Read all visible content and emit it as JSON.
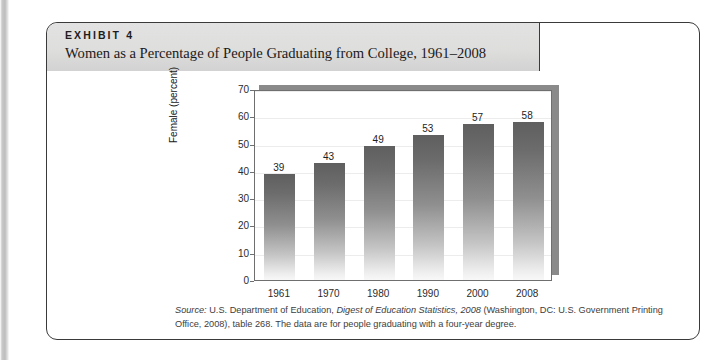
{
  "exhibit": {
    "number_label": "EXHIBIT 4",
    "title": "Women as a Percentage of People Graduating from College, 1961–2008"
  },
  "source": {
    "label": "Source:",
    "text_before_italic": " U.S. Department of Education, ",
    "italic_title": "Digest of Education Statistics, 2008",
    "text_after_italic": " (Washington, DC: U.S. Government Printing Office, 2008), table 268. The data are for people graduating with a four-year degree."
  },
  "chart_data": {
    "type": "bar",
    "title": "Women as a Percentage of People Graduating from College, 1961–2008",
    "categories": [
      "1961",
      "1970",
      "1980",
      "1990",
      "2000",
      "2008"
    ],
    "values": [
      39,
      43,
      49,
      53,
      57,
      58
    ],
    "data_labels": [
      "39",
      "43",
      "49",
      "53",
      "57",
      "58"
    ],
    "xlabel": "",
    "ylabel": "Female (percent)",
    "ylim": [
      0,
      70
    ],
    "ytick_values": [
      0,
      10,
      20,
      30,
      40,
      50,
      60,
      70
    ],
    "ytick_labels": [
      "0",
      "10",
      "20",
      "30",
      "40",
      "50",
      "60",
      "70"
    ],
    "grid": true,
    "legend": "none",
    "bar_color_top": "#5f5f5f",
    "bar_color_bottom": "#f8f8f8"
  }
}
